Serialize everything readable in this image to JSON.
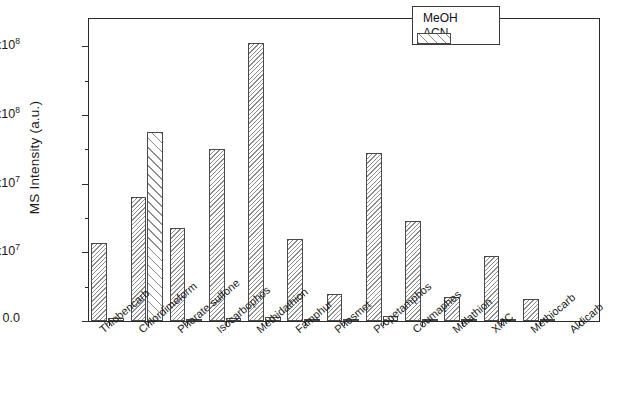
{
  "figure": {
    "ylabel": "MS Intensity (a.u.)",
    "xlabel": "",
    "frame_color": "#2a2a2a",
    "bar_edge_color": "#4a4a4a",
    "hatch_color": "#8d8d8d"
  },
  "legend": {
    "position": "top-right",
    "entries": [
      {
        "label": "MeOH",
        "pattern": "dense-hatch"
      },
      {
        "label": "ACN",
        "pattern": "sparse-hatch"
      }
    ]
  },
  "yaxis": {
    "ticklabels": [
      "0.0",
      "4.0x10",
      "8.0x10",
      "1.2x10",
      "1.6x10"
    ],
    "exponents": [
      "",
      "7",
      "7",
      "8",
      "8"
    ],
    "values": [
      0,
      40000000,
      80000000,
      120000000,
      160000000
    ]
  },
  "chart_data": {
    "type": "bar",
    "title": "",
    "xlabel": "",
    "ylabel": "MS Intensity (a.u.)",
    "ylim": [
      0,
      176000000
    ],
    "grid": false,
    "legend_position": "top-right",
    "categories": [
      "Thiobencarb",
      "Chlordimeform",
      "Phorate sulfone",
      "Isocarbophos",
      "Methidathion",
      "Famphur",
      "Phosmet",
      "Propetamphos",
      "Coumaphos",
      "Malathion",
      "XMC",
      "Methiocarb",
      "Aldicarb"
    ],
    "series": [
      {
        "name": "MeOH",
        "values": [
          45600000,
          72000000,
          54000000,
          100000000,
          162000000,
          48000000,
          15500000,
          98000000,
          58000000,
          14000000,
          38000000,
          13000000,
          0
        ]
      },
      {
        "name": "ACN",
        "values": [
          1600000,
          110000000,
          900000,
          1900000,
          2400000,
          700000,
          400000,
          2800000,
          800000,
          1100000,
          600000,
          500000,
          0
        ]
      }
    ]
  }
}
